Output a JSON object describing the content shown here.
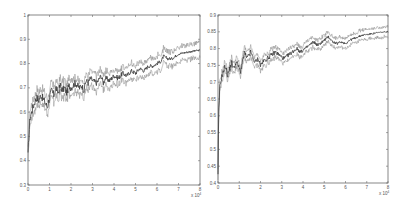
{
  "chart_data": [
    {
      "type": "line",
      "title": "",
      "xlabel": "",
      "ylabel": "",
      "x_multiplier": "x 10^4",
      "xlim": [
        0,
        8
      ],
      "ylim": [
        0.3,
        1.0
      ],
      "xticks": [
        0,
        1,
        2,
        3,
        4,
        5,
        6,
        7,
        8
      ],
      "yticks": [
        0.3,
        0.4,
        0.5,
        0.6,
        0.7,
        0.8,
        0.9,
        1
      ],
      "ytick_labels": [
        "0.3",
        "0.4",
        "0.5",
        "0.6",
        "0.7",
        "0.8",
        "0.9",
        "1"
      ],
      "grid": false,
      "legend": null,
      "box": {
        "left": 28,
        "top": 15,
        "right": 200,
        "bottom": 185
      },
      "series": [
        {
          "name": "mean",
          "x": [
            0,
            0.05,
            0.1,
            0.2,
            0.3,
            0.4,
            0.5,
            0.6,
            0.8,
            0.9,
            1.0,
            1.1,
            1.2,
            1.3,
            1.4,
            1.5,
            1.6,
            1.7,
            1.8,
            1.9,
            2.0,
            2.2,
            2.4,
            2.5,
            2.6,
            2.7,
            2.8,
            2.9,
            3.0,
            3.2,
            3.4,
            3.5,
            3.6,
            3.8,
            4.0,
            4.2,
            4.4,
            4.6,
            4.8,
            5.0,
            5.2,
            5.4,
            5.6,
            5.8,
            6.0,
            6.2,
            6.3,
            6.5,
            6.7,
            7.0,
            7.3,
            7.6,
            8.0
          ],
          "values": [
            0.42,
            0.52,
            0.58,
            0.61,
            0.64,
            0.66,
            0.65,
            0.67,
            0.64,
            0.62,
            0.66,
            0.69,
            0.67,
            0.7,
            0.68,
            0.71,
            0.69,
            0.7,
            0.68,
            0.71,
            0.7,
            0.72,
            0.7,
            0.71,
            0.69,
            0.73,
            0.72,
            0.74,
            0.73,
            0.72,
            0.75,
            0.72,
            0.74,
            0.73,
            0.75,
            0.74,
            0.76,
            0.75,
            0.77,
            0.76,
            0.78,
            0.77,
            0.79,
            0.79,
            0.8,
            0.81,
            0.83,
            0.82,
            0.82,
            0.84,
            0.845,
            0.85,
            0.855
          ]
        },
        {
          "name": "upper bound",
          "offset": 0.03
        },
        {
          "name": "lower bound",
          "offset": -0.03
        }
      ]
    },
    {
      "type": "line",
      "title": "",
      "xlabel": "",
      "ylabel": "",
      "x_multiplier": "x 10^4",
      "xlim": [
        0,
        8
      ],
      "ylim": [
        0.4,
        0.9
      ],
      "xticks": [
        0,
        1,
        2,
        3,
        4,
        5,
        6,
        7,
        8
      ],
      "yticks": [
        0.4,
        0.45,
        0.5,
        0.55,
        0.6,
        0.65,
        0.7,
        0.75,
        0.8,
        0.85,
        0.9
      ],
      "ytick_labels": [
        "0.4",
        "0.45",
        "0.5",
        "0.55",
        "0.6",
        "0.65",
        "0.7",
        "0.75",
        "0.8",
        "0.85",
        "0.9"
      ],
      "grid": false,
      "legend": null,
      "box": {
        "left": 218,
        "top": 15,
        "right": 388,
        "bottom": 183
      },
      "series": [
        {
          "name": "mean",
          "x": [
            0,
            0.03,
            0.08,
            0.15,
            0.25,
            0.35,
            0.45,
            0.55,
            0.65,
            0.75,
            0.85,
            0.95,
            1.05,
            1.15,
            1.25,
            1.35,
            1.45,
            1.55,
            1.65,
            1.75,
            1.9,
            2.0,
            2.1,
            2.3,
            2.5,
            2.7,
            2.9,
            3.1,
            3.3,
            3.5,
            3.7,
            3.9,
            4.1,
            4.3,
            4.5,
            4.7,
            4.9,
            5.1,
            5.2,
            5.4,
            5.6,
            5.8,
            6.0,
            6.2,
            6.4,
            6.6,
            6.8,
            7.0,
            7.3,
            7.6,
            8.0
          ],
          "values": [
            0.42,
            0.6,
            0.68,
            0.71,
            0.73,
            0.75,
            0.72,
            0.74,
            0.76,
            0.74,
            0.76,
            0.75,
            0.73,
            0.76,
            0.79,
            0.77,
            0.78,
            0.79,
            0.77,
            0.76,
            0.77,
            0.75,
            0.76,
            0.77,
            0.78,
            0.79,
            0.78,
            0.77,
            0.78,
            0.79,
            0.8,
            0.79,
            0.8,
            0.81,
            0.82,
            0.81,
            0.82,
            0.83,
            0.835,
            0.82,
            0.815,
            0.82,
            0.815,
            0.825,
            0.83,
            0.835,
            0.84,
            0.842,
            0.845,
            0.848,
            0.85
          ]
        },
        {
          "name": "upper bound",
          "offset": 0.015
        },
        {
          "name": "lower bound",
          "offset": -0.015
        }
      ]
    }
  ]
}
